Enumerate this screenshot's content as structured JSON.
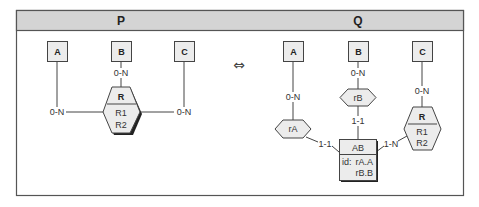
{
  "header": {
    "left_title": "P",
    "right_title": "Q",
    "band_color": "#d4d4d4"
  },
  "equivalence_symbol": "⇔",
  "panel_p": {
    "entities": [
      {
        "id": "A",
        "label": "A"
      },
      {
        "id": "B",
        "label": "B"
      },
      {
        "id": "C",
        "label": "C"
      }
    ],
    "relationship": {
      "name": "R",
      "attributes": [
        "R1",
        "R2"
      ]
    },
    "cardinalities": {
      "A_R": "0-N",
      "B_R": "0-N",
      "C_R": "0-N"
    }
  },
  "panel_q": {
    "entities": [
      {
        "id": "A",
        "label": "A"
      },
      {
        "id": "B",
        "label": "B"
      },
      {
        "id": "C",
        "label": "C"
      },
      {
        "id": "AB",
        "label": "AB",
        "identifier_prefix": "id:",
        "identifier": [
          "rA.A",
          "rB.B"
        ]
      }
    ],
    "relationships": [
      {
        "id": "rA",
        "name": "rA"
      },
      {
        "id": "rB",
        "name": "rB"
      },
      {
        "id": "R",
        "name": "R",
        "attributes": [
          "R1",
          "R2"
        ]
      }
    ],
    "cardinalities": {
      "A_rA": "0-N",
      "AB_rA": "1-1",
      "B_rB": "0-N",
      "AB_rB": "1-1",
      "C_R": "0-N",
      "AB_R": "1-N"
    }
  }
}
